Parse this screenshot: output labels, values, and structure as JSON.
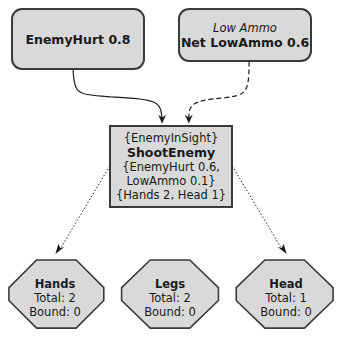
{
  "diagram": {
    "type": "belief-network",
    "colors": {
      "node_fill": "#d9d9d9",
      "stroke": "#3a3a3a",
      "background": "#ffffff"
    },
    "inputs": [
      {
        "id": "enemy-hurt",
        "subtitle": "",
        "label": "EnemyHurt 0.8",
        "shape": "rounded-rect"
      },
      {
        "id": "low-ammo",
        "subtitle": "Low Ammo",
        "label": "Net LowAmmo 0.6",
        "shape": "rounded-rect"
      }
    ],
    "action": {
      "id": "shoot-enemy",
      "precondition": "{EnemyInSight}",
      "name": "ShootEnemy",
      "effects_line1": "{EnemyHurt 0.6,",
      "effects_line2": "LowAmmo 0.1}",
      "resources": "{Hands 2, Head 1}",
      "shape": "rectangle"
    },
    "resources": [
      {
        "name": "Hands",
        "total": "Total: 2",
        "bound": "Bound: 0",
        "shape": "octagon"
      },
      {
        "name": "Legs",
        "total": "Total: 2",
        "bound": "Bound: 0",
        "shape": "octagon"
      },
      {
        "name": "Head",
        "total": "Total: 1",
        "bound": "Bound: 0",
        "shape": "octagon"
      }
    ],
    "edges": [
      {
        "from": "enemy-hurt",
        "to": "shoot-enemy",
        "style": "solid"
      },
      {
        "from": "low-ammo",
        "to": "shoot-enemy",
        "style": "dashed"
      },
      {
        "from": "shoot-enemy",
        "to": "Hands",
        "style": "dotted"
      },
      {
        "from": "shoot-enemy",
        "to": "Head",
        "style": "dotted"
      }
    ]
  }
}
